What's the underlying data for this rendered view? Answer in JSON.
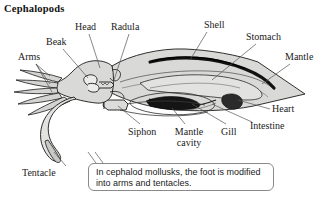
{
  "figure": {
    "title": "Cephalopods"
  },
  "labels": [
    {
      "id": "head",
      "text": "Head"
    },
    {
      "id": "radula",
      "text": "Radula"
    },
    {
      "id": "shell",
      "text": "Shell"
    },
    {
      "id": "stomach",
      "text": "Stomach"
    },
    {
      "id": "mantle",
      "text": "Mantle"
    },
    {
      "id": "beak",
      "text": "Beak"
    },
    {
      "id": "arms",
      "text": "Arms"
    },
    {
      "id": "heart",
      "text": "Heart"
    },
    {
      "id": "intestine",
      "text": "Intestine"
    },
    {
      "id": "siphon",
      "text": "Siphon"
    },
    {
      "id": "mantle-cavity",
      "text": "Mantle cavity"
    },
    {
      "id": "gill",
      "text": "Gill"
    },
    {
      "id": "tentacle",
      "text": "Tentacle"
    }
  ],
  "callout": {
    "text": "In cephalod mollusks, the foot is modified into arms and tentacles."
  },
  "colors": {
    "background": "#ffffff",
    "ink": "#1a1a1a",
    "body_fill": "#d8d8d6",
    "body_fill_light": "#e6e6e4",
    "organ_dark": "#1c1c1c",
    "organ_mid": "#4a4a4a",
    "leader_line": "#555555",
    "callout_border": "#8a8a8a"
  }
}
